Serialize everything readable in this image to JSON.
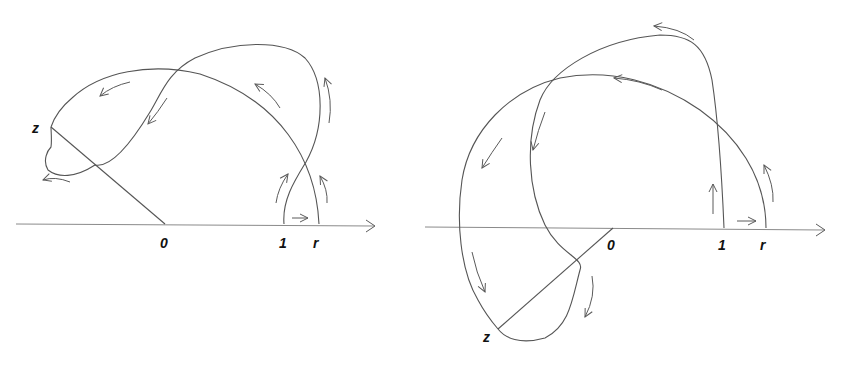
{
  "figure": {
    "left": {
      "labels": {
        "origin": "0",
        "one": "1",
        "r": "r",
        "z": "z"
      }
    },
    "right": {
      "labels": {
        "origin": "0",
        "one": "1",
        "r": "r",
        "z": "z"
      }
    }
  },
  "colors": {
    "stroke": "#555555",
    "axis": "#8a8a8a",
    "label": "#111111",
    "background": "#ffffff"
  }
}
